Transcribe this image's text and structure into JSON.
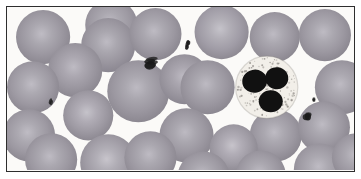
{
  "figure": {
    "kind": "light-microscopy-blood-smear",
    "title": "Peripheral blood smear",
    "frame": {
      "border_color": "#2e2e2e",
      "border_width_px": 1.5,
      "left_px": 6,
      "top_px": 6,
      "width_px": 349,
      "height_px": 166
    },
    "background_color": "#fbfaf8",
    "outer_margin_color": "#ffffff"
  },
  "palette": {
    "plasma_background": "#fbfaf8",
    "rbc_rim": "#8e8a93",
    "rbc_mid": "#9b97a0",
    "rbc_pallor": "#bdbac2",
    "rbc_rim_dark": "#7e7a85",
    "wbc_cytoplasm": "#f2efe9",
    "wbc_granule": "#8f8b86",
    "wbc_nucleus": "#111111",
    "platelet": "#1a1a1a"
  },
  "cells": {
    "red_blood_cells": [
      {
        "id": "rbc-01",
        "cx": 36,
        "cy": 30,
        "r": 27,
        "pallor": 0.46,
        "tone": 1.0
      },
      {
        "id": "rbc-02",
        "cx": 104,
        "cy": 18,
        "r": 26,
        "pallor": 0.42,
        "tone": 0.96
      },
      {
        "id": "rbc-03",
        "cx": 101,
        "cy": 38,
        "r": 27,
        "pallor": 0.44,
        "tone": 1.02
      },
      {
        "id": "rbc-04",
        "cx": 148,
        "cy": 27,
        "r": 26,
        "pallor": 0.44,
        "tone": 0.98
      },
      {
        "id": "rbc-05",
        "cx": 214,
        "cy": 25,
        "r": 27,
        "pallor": 0.56,
        "tone": 0.9
      },
      {
        "id": "rbc-06",
        "cx": 267,
        "cy": 30,
        "r": 25,
        "pallor": 0.44,
        "tone": 0.99
      },
      {
        "id": "rbc-07",
        "cx": 317,
        "cy": 28,
        "r": 26,
        "pallor": 0.44,
        "tone": 0.98
      },
      {
        "id": "rbc-08",
        "cx": 68,
        "cy": 63,
        "r": 27,
        "pallor": 0.44,
        "tone": 1.0
      },
      {
        "id": "rbc-09",
        "cx": 26,
        "cy": 80,
        "r": 26,
        "pallor": 0.46,
        "tone": 0.97
      },
      {
        "id": "rbc-10",
        "cx": 131,
        "cy": 84,
        "r": 31,
        "pallor": 0.42,
        "tone": 1.0
      },
      {
        "id": "rbc-11",
        "cx": 177,
        "cy": 72,
        "r": 25,
        "pallor": 0.4,
        "tone": 1.02
      },
      {
        "id": "rbc-12",
        "cx": 200,
        "cy": 80,
        "r": 27,
        "pallor": 0.42,
        "tone": 1.0
      },
      {
        "id": "rbc-13",
        "cx": 334,
        "cy": 80,
        "r": 27,
        "pallor": 0.44,
        "tone": 0.98
      },
      {
        "id": "rbc-14",
        "cx": 81,
        "cy": 108,
        "r": 25,
        "pallor": 0.56,
        "tone": 0.94
      },
      {
        "id": "rbc-15",
        "cx": 22,
        "cy": 128,
        "r": 26,
        "pallor": 0.46,
        "tone": 0.97
      },
      {
        "id": "rbc-16",
        "cx": 179,
        "cy": 128,
        "r": 27,
        "pallor": 0.42,
        "tone": 1.0
      },
      {
        "id": "rbc-17",
        "cx": 268,
        "cy": 128,
        "r": 26,
        "pallor": 0.44,
        "tone": 0.99
      },
      {
        "id": "rbc-18",
        "cx": 226,
        "cy": 141,
        "r": 24,
        "pallor": 0.58,
        "tone": 0.92
      },
      {
        "id": "rbc-19",
        "cx": 316,
        "cy": 120,
        "r": 26,
        "pallor": 0.44,
        "tone": 0.98
      },
      {
        "id": "rbc-20",
        "cx": 44,
        "cy": 152,
        "r": 26,
        "pallor": 0.44,
        "tone": 0.99
      },
      {
        "id": "rbc-21",
        "cx": 101,
        "cy": 155,
        "r": 28,
        "pallor": 0.6,
        "tone": 0.93
      },
      {
        "id": "rbc-22",
        "cx": 143,
        "cy": 150,
        "r": 26,
        "pallor": 0.44,
        "tone": 0.99
      },
      {
        "id": "rbc-23",
        "cx": 196,
        "cy": 170,
        "r": 26,
        "pallor": 0.44,
        "tone": 0.98
      },
      {
        "id": "rbc-24",
        "cx": 253,
        "cy": 168,
        "r": 25,
        "pallor": 0.44,
        "tone": 0.98
      },
      {
        "id": "rbc-25",
        "cx": 312,
        "cy": 162,
        "r": 26,
        "pallor": 0.46,
        "tone": 0.97
      },
      {
        "id": "rbc-26",
        "cx": 348,
        "cy": 150,
        "r": 24,
        "pallor": 0.44,
        "tone": 0.98
      }
    ],
    "white_blood_cells": [
      {
        "id": "wbc-01",
        "type": "neutrophil",
        "cx": 259,
        "cy": 80,
        "r": 31,
        "granule_count": 190,
        "nucleus_lobes": [
          {
            "cx": -12,
            "cy": -6,
            "rx": 12.5,
            "ry": 11.5,
            "rot": -12
          },
          {
            "cx": 10,
            "cy": -9,
            "rx": 11.5,
            "ry": 11.0,
            "rot": 8
          },
          {
            "cx": 4,
            "cy": 14,
            "rx": 12.0,
            "ry": 11.0,
            "rot": 0
          }
        ]
      }
    ],
    "platelets": [
      {
        "id": "plt-01",
        "cx": 146,
        "cy": 55,
        "rx": 7.5,
        "ry": 4.5,
        "rot": -8,
        "shape": "cluster"
      },
      {
        "id": "plt-02",
        "cx": 181,
        "cy": 38,
        "rx": 2.6,
        "ry": 4.2,
        "rot": 14,
        "shape": "comma"
      },
      {
        "id": "plt-03",
        "cx": 44,
        "cy": 96,
        "rx": 2.0,
        "ry": 4.0,
        "rot": 18,
        "shape": "rod"
      },
      {
        "id": "plt-04",
        "cx": 297,
        "cy": 109,
        "rx": 4.2,
        "ry": 4.0,
        "rot": 0,
        "shape": "comma"
      },
      {
        "id": "plt-05",
        "cx": 305,
        "cy": 91,
        "rx": 1.9,
        "ry": 2.6,
        "rot": 0,
        "shape": "dot"
      }
    ]
  },
  "counts": {
    "red_blood_cells": 26,
    "white_blood_cells": 1,
    "platelets": 5
  }
}
